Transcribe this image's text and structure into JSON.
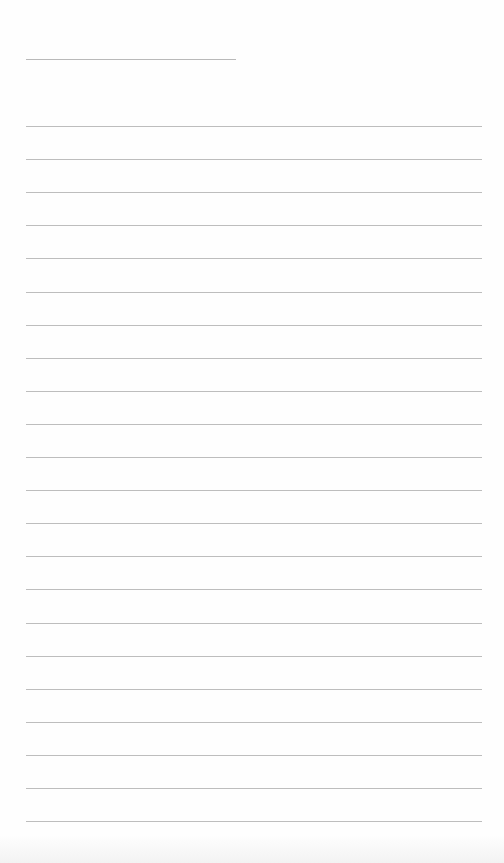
{
  "page": {
    "type": "lined-paper",
    "background": "#fefefe",
    "line_color": "#bdbdbd",
    "header_line": {
      "text": ""
    },
    "lines": [
      {
        "text": ""
      },
      {
        "text": ""
      },
      {
        "text": ""
      },
      {
        "text": ""
      },
      {
        "text": ""
      },
      {
        "text": ""
      },
      {
        "text": ""
      },
      {
        "text": ""
      },
      {
        "text": ""
      },
      {
        "text": ""
      },
      {
        "text": ""
      },
      {
        "text": ""
      },
      {
        "text": ""
      },
      {
        "text": ""
      },
      {
        "text": ""
      },
      {
        "text": ""
      },
      {
        "text": ""
      },
      {
        "text": ""
      },
      {
        "text": ""
      },
      {
        "text": ""
      },
      {
        "text": ""
      },
      {
        "text": ""
      }
    ]
  }
}
